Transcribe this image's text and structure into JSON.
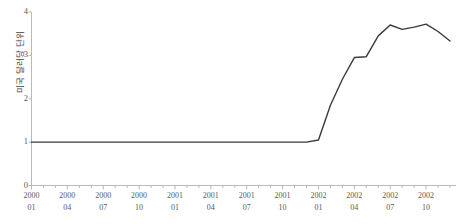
{
  "axes": {
    "y_label": "미국 달러당 단위",
    "y_ticks": [
      "0",
      "1",
      "2",
      "3",
      "4"
    ],
    "x_ticks": [
      {
        "year": "2000",
        "month": "01"
      },
      {
        "year": "2000",
        "month": "04"
      },
      {
        "year": "2000",
        "month": "07"
      },
      {
        "year": "2000",
        "month": "10"
      },
      {
        "year": "2001",
        "month": "01"
      },
      {
        "year": "2001",
        "month": "04"
      },
      {
        "year": "2001",
        "month": "07"
      },
      {
        "year": "2001",
        "month": "10"
      },
      {
        "year": "2002",
        "month": "01"
      },
      {
        "year": "2002",
        "month": "04"
      },
      {
        "year": "2002",
        "month": "07"
      },
      {
        "year": "2002",
        "month": "10"
      }
    ]
  },
  "style": {
    "line_color": "#3a3a3a",
    "axis_color": "#b9b9b9",
    "background": "#ffffff"
  },
  "chart_data": {
    "type": "line",
    "title": "",
    "xlabel": "",
    "ylabel": "미국 달러당 단위",
    "ylim": [
      0,
      4
    ],
    "yticks": [
      0,
      1,
      2,
      3,
      4
    ],
    "grid": false,
    "legend": false,
    "x": [
      "2000-01",
      "2000-02",
      "2000-03",
      "2000-04",
      "2000-05",
      "2000-06",
      "2000-07",
      "2000-08",
      "2000-09",
      "2000-10",
      "2000-11",
      "2000-12",
      "2001-01",
      "2001-02",
      "2001-03",
      "2001-04",
      "2001-05",
      "2001-06",
      "2001-07",
      "2001-08",
      "2001-09",
      "2001-10",
      "2001-11",
      "2001-12",
      "2002-01",
      "2002-02",
      "2002-03",
      "2002-04",
      "2002-05",
      "2002-06",
      "2002-07",
      "2002-08",
      "2002-09",
      "2002-10",
      "2002-11",
      "2002-12"
    ],
    "xtick_labels": [
      "2000 01",
      "2000 04",
      "2000 07",
      "2000 10",
      "2001 01",
      "2001 04",
      "2001 07",
      "2001 10",
      "2002 01",
      "2002 04",
      "2002 07",
      "2002 10"
    ],
    "series": [
      {
        "name": "미국 달러당 단위",
        "values": [
          1.0,
          1.0,
          1.0,
          1.0,
          1.0,
          1.0,
          1.0,
          1.0,
          1.0,
          1.0,
          1.0,
          1.0,
          1.0,
          1.0,
          1.0,
          1.0,
          1.0,
          1.0,
          1.0,
          1.0,
          1.0,
          1.0,
          1.0,
          1.0,
          1.05,
          1.85,
          2.45,
          2.95,
          2.97,
          3.45,
          3.7,
          3.6,
          3.65,
          3.72,
          3.55,
          3.33
        ]
      }
    ]
  }
}
